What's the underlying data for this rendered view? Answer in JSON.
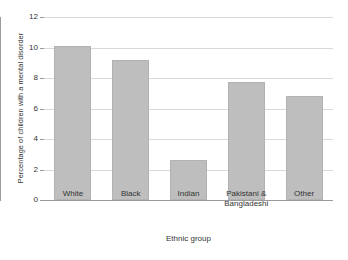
{
  "chart_data": {
    "type": "bar",
    "title": "",
    "xlabel": "Ethnic group",
    "ylabel": "Percentage of children with a mental disorder",
    "categories": [
      "White",
      "Black",
      "Indian",
      "Pakistani &\nBangladeshi",
      "Other"
    ],
    "category_labels": [
      {
        "line1": "White",
        "line2": ""
      },
      {
        "line1": "Black",
        "line2": ""
      },
      {
        "line1": "Indian",
        "line2": ""
      },
      {
        "line1": "Pakistani &",
        "line2": "Bangladeshi"
      },
      {
        "line1": "Other",
        "line2": ""
      }
    ],
    "values": [
      10.1,
      9.2,
      2.6,
      7.75,
      6.85
    ],
    "ylim": [
      0,
      12
    ],
    "ytick_step": 2,
    "yticks": [
      0,
      2,
      4,
      6,
      8,
      10,
      12
    ],
    "ytick_labels": [
      "0",
      "2",
      "4",
      "6",
      "8",
      "10",
      "12"
    ],
    "grid": true,
    "legend": false,
    "bar_color": "#bebebe",
    "bar_border_color": "#b2b2b2",
    "gridline_color": "#d9d9d9",
    "axis_color": "#9a9a9a",
    "background_color": "#ffffff"
  }
}
